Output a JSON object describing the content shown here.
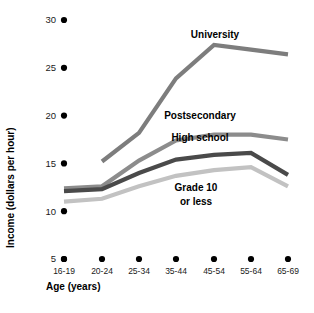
{
  "chart_data": {
    "type": "line",
    "title": "",
    "xlabel": "Age (years)",
    "ylabel": "Income (dollars per hour)",
    "categories": [
      "16-19",
      "20-24",
      "25-34",
      "35-44",
      "45-54",
      "55-64",
      "65-69"
    ],
    "ylim": [
      5,
      30
    ],
    "yticks": [
      5,
      10,
      15,
      20,
      25,
      30
    ],
    "ytick_labels": [
      "5",
      "10",
      "15",
      "20",
      "25",
      "30"
    ],
    "grid": false,
    "legend": "inline-labels",
    "series": [
      {
        "name": "University",
        "color": "#7d7d7d",
        "values": [
          null,
          15.2,
          18.2,
          23.9,
          27.4,
          26.9,
          26.4
        ]
      },
      {
        "name": "Postsecondary",
        "color": "#8c8c8c",
        "values": [
          12.4,
          12.6,
          15.3,
          17.4,
          18.0,
          18.0,
          17.5
        ]
      },
      {
        "name": "High school",
        "color": "#4a4a4a",
        "values": [
          12.1,
          12.3,
          14.0,
          15.4,
          15.9,
          16.1,
          13.8
        ]
      },
      {
        "name": "Grade 10 or less",
        "color": "#c2c2c2",
        "values": [
          11.0,
          11.3,
          12.6,
          13.7,
          14.3,
          14.6,
          12.6
        ]
      }
    ],
    "annotations": [
      {
        "text": "University",
        "x": 215,
        "y": 38
      },
      {
        "text": "Postsecondary",
        "x": 200,
        "y": 119
      },
      {
        "text": "High school",
        "x": 200,
        "y": 141
      },
      {
        "text": "Grade 10",
        "x": 196,
        "y": 191
      },
      {
        "text": "or less",
        "x": 196,
        "y": 205
      }
    ]
  }
}
